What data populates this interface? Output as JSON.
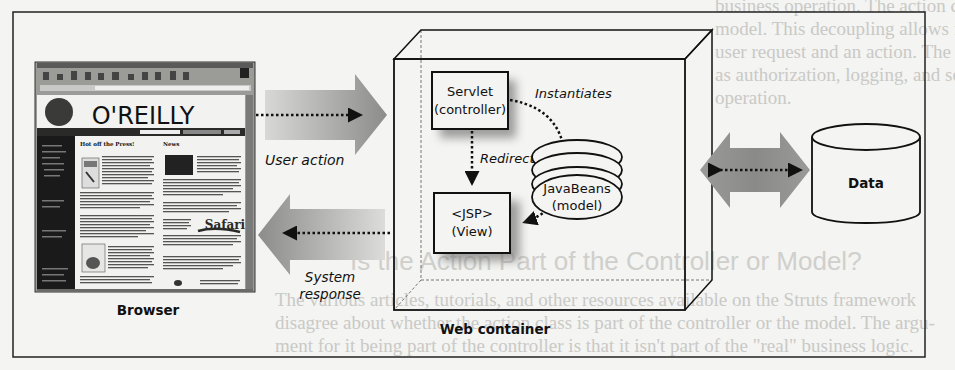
{
  "background_bleed_text": {
    "lines_top": [
      "business operation. The action class decouples the client request from the business",
      "model. This decoupling allows for more than a one-to-one mapping between the",
      "user request and an action. The action class also can perform other functions, such",
      "as authorization, logging, and session validation, before invoking the business",
      "operation."
    ],
    "heading": "Is the Action Part of the Controller or Model?",
    "lines_bottom": [
      "The various articles, tutorials, and other resources available on the Struts framework",
      "disagree about whether the action class is part of the controller or the model. The argu-",
      "ment for it being part of the controller is that it isn't part of the \"real\" business logic."
    ]
  },
  "diagram": {
    "browser": {
      "label": "Browser",
      "screenshot": {
        "logo": "O'REILLY",
        "col1_heading": "Hot off the Press!",
        "col2_heading": "News",
        "promo": "Safari"
      }
    },
    "user_action_label": "User action",
    "system_response_label_line1": "System",
    "system_response_label_line2": "response",
    "web_container": {
      "label": "Web container",
      "servlet_line1": "Servlet",
      "servlet_line2": "(controller)",
      "jsp_line1": "<JSP>",
      "jsp_line2": "(View)",
      "javabeans_line1": "JavaBeans",
      "javabeans_line2": "(model)",
      "instantiates_label": "Instantiates",
      "redirect_label": "Redirect"
    },
    "data_store_label": "Data"
  },
  "colors": {
    "ink": "#111111",
    "arrow_gray_dark": "#8a8a88",
    "arrow_gray_light": "#d6d6d4",
    "paper": "#f4f4f2",
    "screenshot_sidebar": "#1a1a1a"
  }
}
